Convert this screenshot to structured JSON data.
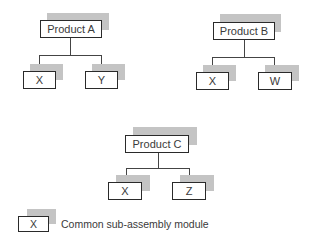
{
  "diagram": {
    "trees": [
      {
        "root": "Product A",
        "children": [
          "X",
          "Y"
        ]
      },
      {
        "root": "Product B",
        "children": [
          "X",
          "W"
        ]
      },
      {
        "root": "Product C",
        "children": [
          "X",
          "Z"
        ]
      }
    ],
    "legend": {
      "symbol_label": "X",
      "description": "Common sub-assembly module"
    },
    "colors": {
      "box_border": "#2a2a2a",
      "box_fill": "#ffffff",
      "shadow": "#c4c4c4",
      "connector": "#444444",
      "text": "#3a3a3a"
    }
  }
}
